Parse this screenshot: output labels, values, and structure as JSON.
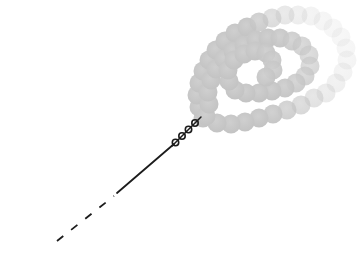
{
  "figure": {
    "kind": "polymer-bead-chain-spiral-diagram",
    "canvas": {
      "width": 364,
      "height": 263,
      "background": "#ffffff"
    },
    "colors": {
      "line": "#1c1c1c",
      "bead_fill_center": "#cfcfcf",
      "bead_fill_edge": "#c2c2c2"
    },
    "dashed_tail": {
      "x1": 57,
      "y1": 241,
      "x2": 114,
      "y2": 196,
      "stroke_width": 1.8,
      "dash_pattern": "8 10"
    },
    "solid_stem": {
      "x1": 117,
      "y1": 193,
      "x2": 174,
      "y2": 144,
      "stroke_width": 1.8
    },
    "twist_coil": {
      "underline": {
        "x1": 172,
        "y1": 146,
        "x2": 201,
        "y2": 117
      },
      "loop_radius": 3.2,
      "stroke_width": 1.6,
      "loops": [
        [
          175.5,
          142.5
        ],
        [
          182.0,
          136.0
        ],
        [
          188.5,
          129.5
        ],
        [
          195.0,
          123.0
        ]
      ]
    },
    "beads": {
      "radius": 9.5,
      "chain": [
        [
          203,
          118,
          1
        ],
        [
          199,
          107,
          1
        ],
        [
          197,
          95,
          1
        ],
        [
          199,
          83,
          1
        ],
        [
          203,
          71,
          1
        ],
        [
          209,
          60,
          1
        ],
        [
          216,
          50,
          1
        ],
        [
          225,
          41,
          1
        ],
        [
          235,
          33,
          1
        ],
        [
          247,
          27,
          1
        ],
        [
          259,
          22,
          0.85
        ],
        [
          272,
          18,
          0.6
        ],
        [
          285,
          15,
          0.42
        ],
        [
          298,
          15,
          0.3
        ],
        [
          311,
          16,
          0.22
        ],
        [
          323,
          21,
          0.18
        ],
        [
          333,
          28,
          0.16
        ],
        [
          341,
          37,
          0.16
        ],
        [
          346,
          48,
          0.17
        ],
        [
          347,
          60,
          0.19
        ],
        [
          343,
          72,
          0.22
        ],
        [
          336,
          83,
          0.27
        ],
        [
          326,
          93,
          0.35
        ],
        [
          314,
          98,
          0.5
        ],
        [
          301,
          105,
          0.65
        ],
        [
          287,
          110,
          0.8
        ],
        [
          273,
          114,
          0.95
        ],
        [
          259,
          118,
          1
        ],
        [
          245,
          122,
          1
        ],
        [
          231,
          124,
          1
        ],
        [
          217,
          123,
          1
        ],
        [
          206,
          116,
          1
        ],
        [
          209,
          104,
          1
        ],
        [
          208,
          92,
          1
        ],
        [
          211,
          80,
          1
        ],
        [
          216,
          69,
          1
        ],
        [
          224,
          59,
          1
        ],
        [
          233,
          51,
          1
        ],
        [
          244,
          45,
          1
        ],
        [
          256,
          40,
          1
        ],
        [
          268,
          38,
          1
        ],
        [
          280,
          38,
          0.95
        ],
        [
          292,
          41,
          0.85
        ],
        [
          302,
          46,
          0.75
        ],
        [
          309,
          55,
          0.68
        ],
        [
          310,
          66,
          0.68
        ],
        [
          305,
          76,
          0.75
        ],
        [
          296,
          83,
          0.85
        ],
        [
          285,
          88,
          0.95
        ],
        [
          272,
          91,
          1
        ],
        [
          259,
          93,
          1
        ],
        [
          246,
          93,
          1
        ],
        [
          235,
          90,
          1
        ],
        [
          229,
          81,
          1
        ],
        [
          228,
          70,
          1
        ],
        [
          234,
          60,
          1
        ],
        [
          244,
          54,
          1
        ],
        [
          255,
          51,
          1
        ],
        [
          266,
          53,
          0.95
        ],
        [
          272,
          60,
          0.9
        ],
        [
          273,
          70,
          0.9
        ],
        [
          266,
          77,
          0.95
        ]
      ]
    }
  }
}
